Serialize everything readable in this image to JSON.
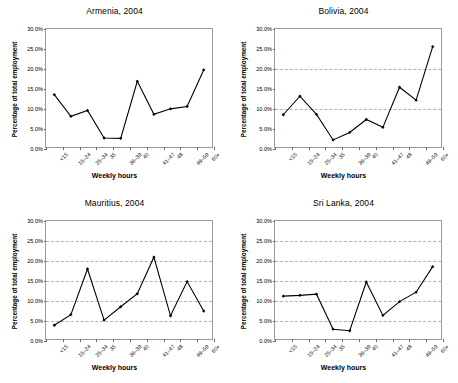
{
  "figure": {
    "background": "#ffffff",
    "series_color": "#000000",
    "gridline_color": "#aab4c8",
    "axis_color": "#9a9a9a",
    "categories": [
      "<15",
      "15–24",
      "25–34",
      "35",
      "36–39",
      "40",
      "41–47",
      "48",
      "49–59",
      "60+"
    ],
    "ytick_labels": [
      "0.0%",
      "5.0%",
      "10.0%",
      "15.0%",
      "20.0%",
      "25.0%",
      "30.0%"
    ],
    "ytick_values": [
      0,
      5,
      10,
      15,
      20,
      25,
      30
    ],
    "xlabel": "Weekly hours",
    "ylabel": "Percentage of total employment"
  },
  "chart_data": [
    {
      "type": "line",
      "title": "Armenia, 2004",
      "xlabel": "Weekly hours",
      "ylabel": "Percentage of total employment",
      "categories": [
        "<15",
        "15–24",
        "25–34",
        "35",
        "36–39",
        "40",
        "41–47",
        "48",
        "49–59",
        "60+"
      ],
      "values": [
        13.3,
        7.8,
        9.3,
        2.3,
        2.2,
        16.7,
        8.3,
        9.7,
        10.3,
        19.6
      ],
      "ylim": [
        0,
        30
      ],
      "yticks": [
        0,
        5,
        10,
        15,
        20,
        25,
        30
      ],
      "gridlines": [],
      "grid": false,
      "legend": "none",
      "marker": "diamond"
    },
    {
      "type": "line",
      "title": "Bolivia, 2004",
      "xlabel": "Weekly hours",
      "ylabel": "Percentage of total employment",
      "categories": [
        "<15",
        "15–24",
        "25–34",
        "35",
        "36–39",
        "40",
        "41–47",
        "48",
        "49–59",
        "60+"
      ],
      "values": [
        8.2,
        12.9,
        8.3,
        1.8,
        3.7,
        7.0,
        5.0,
        15.2,
        11.9,
        25.5
      ],
      "ylim": [
        0,
        30
      ],
      "yticks": [
        0,
        5,
        10,
        15,
        20,
        25,
        30
      ],
      "gridlines": [
        10,
        20
      ],
      "grid": true,
      "legend": "none",
      "marker": "diamond"
    },
    {
      "type": "line",
      "title": "Mauritius, 2004",
      "xlabel": "Weekly hours",
      "ylabel": "Percentage of total employment",
      "categories": [
        "<15",
        "15–24",
        "25–34",
        "35",
        "36–39",
        "40",
        "41–47",
        "48",
        "49–59",
        "60+"
      ],
      "values": [
        3.5,
        6.2,
        17.8,
        4.8,
        8.2,
        11.5,
        20.8,
        5.9,
        14.6,
        7.1
      ],
      "ylim": [
        0,
        30
      ],
      "yticks": [
        0,
        5,
        10,
        15,
        20,
        25,
        30
      ],
      "gridlines": [
        5,
        10,
        15,
        20,
        25
      ],
      "grid": true,
      "legend": "none",
      "marker": "diamond"
    },
    {
      "type": "line",
      "title": "Sri Lanka, 2004",
      "xlabel": "Weekly hours",
      "ylabel": "Percentage of total employment",
      "categories": [
        "<15",
        "15–24",
        "25–34",
        "35",
        "36–39",
        "40",
        "41–47",
        "48",
        "49–59",
        "60+"
      ],
      "values": [
        10.9,
        11.1,
        11.4,
        2.5,
        2.1,
        14.5,
        6.0,
        9.5,
        11.9,
        18.4
      ],
      "ylim": [
        0,
        30
      ],
      "yticks": [
        0,
        5,
        10,
        15,
        20,
        25,
        30
      ],
      "gridlines": [
        5,
        10,
        15,
        20,
        25
      ],
      "grid": true,
      "legend": "none",
      "marker": "diamond"
    }
  ]
}
